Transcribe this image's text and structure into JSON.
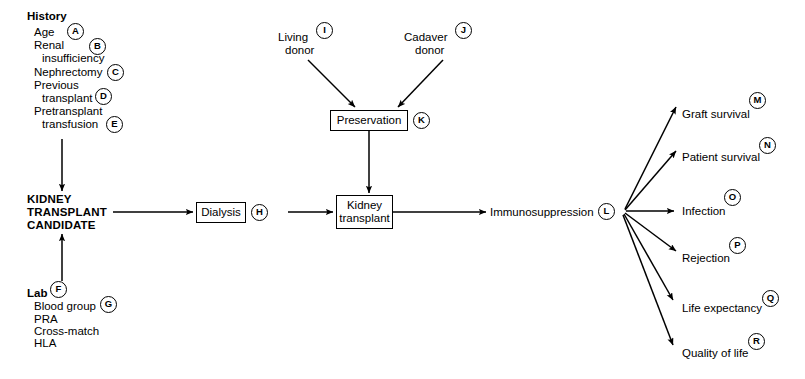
{
  "diagram": {
    "groups": {
      "history": {
        "heading": "History",
        "items": [
          "Age",
          "Renal",
          "insufficiency",
          "Nephrectomy",
          "Previous",
          "transplant",
          "Pretransplant",
          "transfusion"
        ]
      },
      "lab": {
        "heading": "Lab",
        "items": [
          "Blood group",
          "PRA",
          "Cross-match",
          "HLA"
        ]
      },
      "candidate": {
        "line1": "KIDNEY",
        "line2": "TRANSPLANT",
        "line3": "CANDIDATE"
      },
      "donors": {
        "living_line1": "Living",
        "living_line2": "donor",
        "cadaver_line1": "Cadaver",
        "cadaver_line2": "donor"
      }
    },
    "boxes": {
      "dialysis": "Dialysis",
      "preservation": "Preservation",
      "kidney_transplant_line1": "Kidney",
      "kidney_transplant_line2": "transplant"
    },
    "immunosuppression": "Immunosuppression",
    "outcomes": [
      {
        "label": "Graft survival",
        "tag": "M"
      },
      {
        "label": "Patient survival",
        "tag": "N"
      },
      {
        "label": "Infection",
        "tag": "O"
      },
      {
        "label": "Rejection",
        "tag": "P"
      },
      {
        "label": "Life expectancy",
        "tag": "Q"
      },
      {
        "label": "Quality of life",
        "tag": "R"
      }
    ],
    "tags": {
      "a": "A",
      "b": "B",
      "c": "C",
      "d": "D",
      "e": "E",
      "f": "F",
      "g": "G",
      "h": "H",
      "i": "I",
      "j": "J",
      "k": "K",
      "l": "L"
    },
    "colors": {
      "line": "#000000",
      "background": "#ffffff",
      "text": "#000000"
    }
  }
}
